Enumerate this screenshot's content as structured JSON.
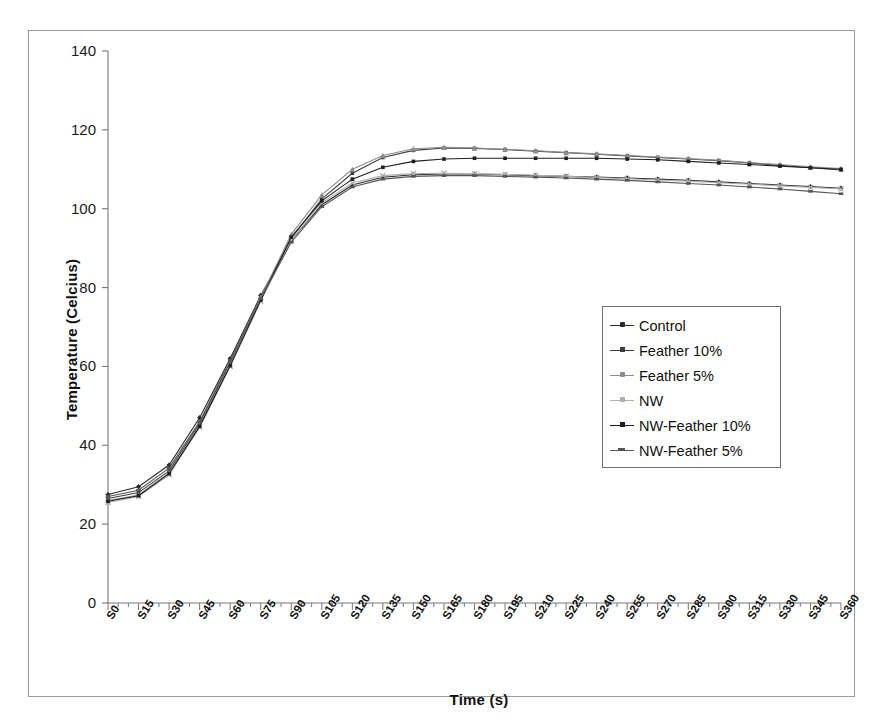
{
  "chart_data": {
    "type": "line",
    "title": "",
    "xlabel": "Time (s)",
    "ylabel": "Temperature (Celcius)",
    "ylim": [
      0,
      140
    ],
    "ytick_step": 20,
    "yticks": [
      0,
      20,
      40,
      60,
      80,
      100,
      120,
      140
    ],
    "grid": false,
    "legend_position": "center-right",
    "x": [
      "S0",
      "S15",
      "S30",
      "S45",
      "S60",
      "S75",
      "S90",
      "S105",
      "S120",
      "S135",
      "S150",
      "S165",
      "S180",
      "S195",
      "S210",
      "S225",
      "S240",
      "S255",
      "S270",
      "S285",
      "S300",
      "S315",
      "S330",
      "S345",
      "S360"
    ],
    "categories": [
      "S0",
      "S15",
      "S30",
      "S45",
      "S60",
      "S75",
      "S90",
      "S105",
      "S120",
      "S135",
      "S150",
      "S165",
      "S180",
      "S195",
      "S210",
      "S225",
      "S240",
      "S255",
      "S270",
      "S285",
      "S300",
      "S315",
      "S330",
      "S345",
      "S360"
    ],
    "series": [
      {
        "name": "Control",
        "color": "#2b2b2b",
        "marker": "diamond",
        "values": [
          27.5,
          29.5,
          35.0,
          47.0,
          62.0,
          78.0,
          92.0,
          101.0,
          106.0,
          108.0,
          108.6,
          108.8,
          108.8,
          108.6,
          108.4,
          108.2,
          108.0,
          107.8,
          107.5,
          107.2,
          106.8,
          106.4,
          106.0,
          105.6,
          105.2
        ]
      },
      {
        "name": "Feather 10%",
        "color": "#3d3d3d",
        "marker": "square",
        "values": [
          26.5,
          28.0,
          33.5,
          45.5,
          61.0,
          77.0,
          92.5,
          102.5,
          109.0,
          113.0,
          114.8,
          115.4,
          115.3,
          115.0,
          114.6,
          114.2,
          113.8,
          113.4,
          113.0,
          112.6,
          112.2,
          111.6,
          111.0,
          110.4,
          109.8
        ]
      },
      {
        "name": "Feather 5%",
        "color": "#8c8c8c",
        "marker": "triangle",
        "values": [
          26.0,
          27.4,
          33.0,
          45.0,
          60.5,
          77.5,
          93.5,
          103.5,
          110.0,
          113.5,
          115.2,
          115.6,
          115.4,
          115.1,
          114.7,
          114.3,
          113.9,
          113.5,
          113.1,
          112.7,
          112.3,
          111.7,
          111.2,
          110.6,
          110.2
        ]
      },
      {
        "name": "NW",
        "color": "#b0b0b0",
        "marker": "cross",
        "values": [
          25.5,
          27.0,
          32.5,
          44.5,
          60.0,
          76.5,
          92.0,
          101.5,
          106.5,
          108.4,
          108.9,
          109.0,
          108.9,
          108.7,
          108.5,
          108.2,
          107.9,
          107.6,
          107.3,
          107.0,
          106.6,
          106.2,
          105.8,
          105.4,
          105.0
        ]
      },
      {
        "name": "NW-Feather 10%",
        "color": "#1f1f1f",
        "marker": "dot",
        "values": [
          25.8,
          27.2,
          32.8,
          44.8,
          60.2,
          76.8,
          92.8,
          102.0,
          107.5,
          110.5,
          112.0,
          112.6,
          112.8,
          112.8,
          112.8,
          112.8,
          112.8,
          112.6,
          112.4,
          112.0,
          111.6,
          111.2,
          110.8,
          110.4,
          110.0
        ]
      },
      {
        "name": "NW-Feather 5%",
        "color": "#555555",
        "marker": "bar",
        "values": [
          27.0,
          28.6,
          34.2,
          46.0,
          61.5,
          77.2,
          91.5,
          100.5,
          105.5,
          107.5,
          108.2,
          108.4,
          108.4,
          108.2,
          108.0,
          107.8,
          107.5,
          107.2,
          106.8,
          106.4,
          106.0,
          105.5,
          105.0,
          104.4,
          103.8
        ]
      }
    ]
  },
  "axes": {
    "y_title": "Temperature (Celcius)",
    "x_title": "Time (s)",
    "y_ticks": [
      "0",
      "20",
      "40",
      "60",
      "80",
      "100",
      "120",
      "140"
    ]
  },
  "legend": {
    "items": [
      {
        "label": "Control"
      },
      {
        "label": "Feather 10%"
      },
      {
        "label": "Feather 5%"
      },
      {
        "label": "NW"
      },
      {
        "label": "NW-Feather 10%"
      },
      {
        "label": "NW-Feather 5%"
      }
    ]
  }
}
